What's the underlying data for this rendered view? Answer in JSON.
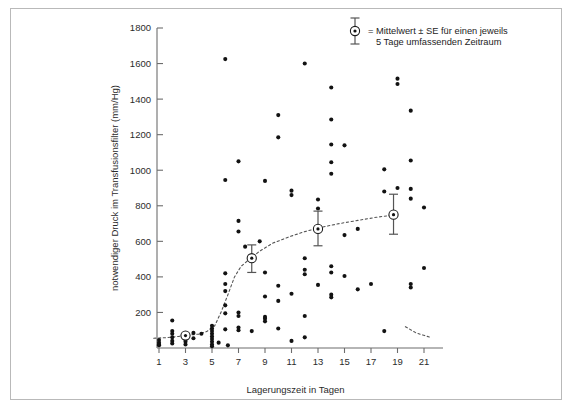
{
  "figure": {
    "background_color": "#ffffff",
    "frame_color": "#b9b9b9",
    "point_color": "#121212",
    "curve_color": "#555555",
    "axis_color": "#6d6d6d"
  },
  "legend": {
    "line1": "= Mittelwert ± SE für einen jeweils",
    "line2": "5 Tage umfassenden Zeitraum",
    "marker_name": "mean-se-marker"
  },
  "chart_data": {
    "type": "scatter",
    "title": "",
    "xlabel": "Lagerungszeit in Tagen",
    "ylabel": "notwendiger Druck im Transfusionsfilter (mm/Hg)",
    "xlim": [
      0,
      22
    ],
    "ylim": [
      0,
      1800
    ],
    "xticks": [
      1,
      3,
      5,
      7,
      9,
      11,
      13,
      15,
      17,
      19,
      21
    ],
    "yticks": [
      200,
      400,
      600,
      800,
      1000,
      1200,
      1400,
      1600,
      1800
    ],
    "grid": false,
    "legend_position": "top-right",
    "points": [
      [
        1,
        30
      ],
      [
        1,
        20
      ],
      [
        1,
        45
      ],
      [
        1,
        15
      ],
      [
        2,
        155
      ],
      [
        2,
        95
      ],
      [
        2,
        80
      ],
      [
        2,
        60
      ],
      [
        2,
        40
      ],
      [
        2,
        25
      ],
      [
        3,
        70
      ],
      [
        3,
        50
      ],
      [
        3,
        35
      ],
      [
        3,
        20
      ],
      [
        3.6,
        85
      ],
      [
        3.6,
        55
      ],
      [
        4.2,
        80
      ],
      [
        5,
        125
      ],
      [
        5,
        110
      ],
      [
        5,
        95
      ],
      [
        5,
        80
      ],
      [
        5,
        65
      ],
      [
        5,
        50
      ],
      [
        5,
        35
      ],
      [
        5,
        20
      ],
      [
        5,
        10
      ],
      [
        5.5,
        30
      ],
      [
        6,
        1625
      ],
      [
        6,
        945
      ],
      [
        6,
        420
      ],
      [
        6,
        360
      ],
      [
        6,
        320
      ],
      [
        6,
        240
      ],
      [
        6,
        195
      ],
      [
        6,
        105
      ],
      [
        6.2,
        15
      ],
      [
        7,
        1050
      ],
      [
        7,
        715
      ],
      [
        7,
        655
      ],
      [
        7,
        200
      ],
      [
        7,
        180
      ],
      [
        7,
        115
      ],
      [
        7,
        100
      ],
      [
        7.5,
        570
      ],
      [
        8,
        500
      ],
      [
        8,
        95
      ],
      [
        8.6,
        600
      ],
      [
        9,
        940
      ],
      [
        9,
        425
      ],
      [
        9,
        290
      ],
      [
        9,
        175
      ],
      [
        9,
        165
      ],
      [
        9,
        150
      ],
      [
        10,
        1310
      ],
      [
        10,
        1185
      ],
      [
        10,
        350
      ],
      [
        10,
        265
      ],
      [
        10,
        110
      ],
      [
        11,
        885
      ],
      [
        11,
        860
      ],
      [
        11,
        305
      ],
      [
        11,
        40
      ],
      [
        12,
        1600
      ],
      [
        12,
        505
      ],
      [
        12,
        440
      ],
      [
        12,
        415
      ],
      [
        12,
        180
      ],
      [
        12,
        60
      ],
      [
        13,
        835
      ],
      [
        13,
        785
      ],
      [
        13,
        355
      ],
      [
        14,
        1465
      ],
      [
        14,
        1285
      ],
      [
        14,
        1145
      ],
      [
        14,
        1045
      ],
      [
        14,
        980
      ],
      [
        14,
        460
      ],
      [
        14,
        425
      ],
      [
        14,
        300
      ],
      [
        14,
        285
      ],
      [
        15,
        1140
      ],
      [
        15,
        635
      ],
      [
        15,
        405
      ],
      [
        16,
        670
      ],
      [
        16,
        330
      ],
      [
        17,
        360
      ],
      [
        18,
        1005
      ],
      [
        18,
        880
      ],
      [
        18,
        95
      ],
      [
        19,
        1485
      ],
      [
        19,
        1515
      ],
      [
        19,
        900
      ],
      [
        20,
        1335
      ],
      [
        20,
        1055
      ],
      [
        20,
        895
      ],
      [
        20,
        840
      ],
      [
        20,
        360
      ],
      [
        20,
        340
      ],
      [
        21,
        790
      ],
      [
        21,
        450
      ]
    ],
    "means": [
      {
        "x": 3,
        "y": 70,
        "se_upper": 0,
        "se_lower": 0
      },
      {
        "x": 8,
        "y": 505,
        "se_upper": 75,
        "se_lower": 80
      },
      {
        "x": 13,
        "y": 670,
        "se_upper": 100,
        "se_lower": 95
      },
      {
        "x": 18.7,
        "y": 750,
        "se_upper": 115,
        "se_lower": 110
      }
    ],
    "trend_curve": [
      [
        0.6,
        55
      ],
      [
        1.5,
        58
      ],
      [
        2.5,
        65
      ],
      [
        3.2,
        72
      ],
      [
        4.0,
        78
      ],
      [
        4.6,
        92
      ],
      [
        5.2,
        125
      ],
      [
        5.7,
        205
      ],
      [
        6.2,
        300
      ],
      [
        6.7,
        400
      ],
      [
        7.2,
        460
      ],
      [
        7.8,
        498
      ],
      [
        8.6,
        545
      ],
      [
        9.6,
        590
      ],
      [
        10.8,
        625
      ],
      [
        12.0,
        655
      ],
      [
        13.2,
        678
      ],
      [
        14.6,
        700
      ],
      [
        16.0,
        718
      ],
      [
        17.4,
        735
      ],
      [
        18.7,
        748
      ]
    ],
    "trend_tail": [
      [
        19.6,
        120
      ],
      [
        20.4,
        85
      ],
      [
        21.4,
        62
      ]
    ]
  }
}
